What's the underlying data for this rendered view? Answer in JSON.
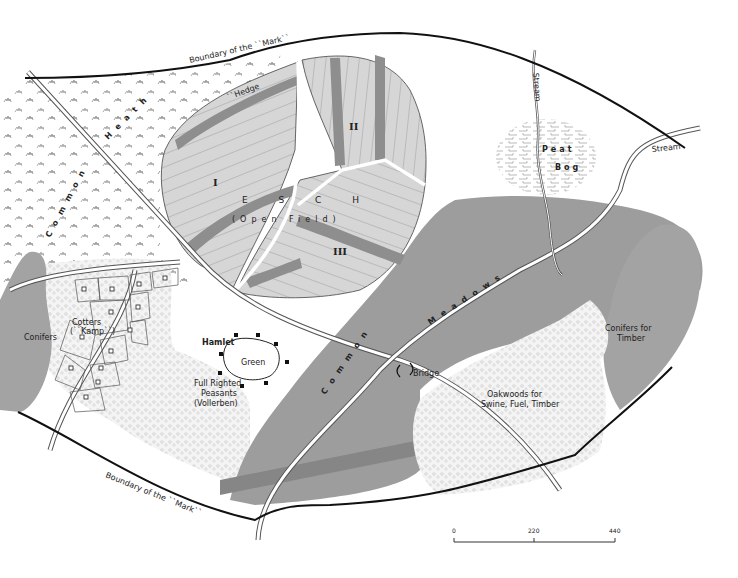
{
  "map": {
    "title": "Medieval Germanic village Mark (Esch and commons)",
    "colors": {
      "background": "#ffffff",
      "field_light": "#d4d4d4",
      "field_dark_strip": "#8e8e8e",
      "meadow_gray": "#9d9d9d",
      "conifer_gray": "#a3a3a3",
      "oakwood_stipple": "#f3f3f3",
      "boundary_line": "#111111",
      "road_edge": "#555555"
    },
    "labels": {
      "boundary_top": "Boundary of the ``Mark``",
      "boundary_bottom": "Boundary of the ``Mark``",
      "hedge": "``Hedge",
      "heath": "Heath",
      "common_heath": "Common",
      "stream_top": "Stream",
      "stream_right": "Stream",
      "peat_bog_line1": "Peat",
      "peat_bog_line2": "Bog",
      "esch": "E S C H",
      "open_field": "(Open Field)",
      "field_I": "I",
      "field_II": "II",
      "field_III": "III",
      "common_meadows_1": "Common",
      "common_meadows_2": "Meadows",
      "bridge": "Bridge",
      "conifers_left": "Conifers",
      "conifers_timber_1": "Conifers for",
      "conifers_timber_2": "Timber",
      "oakwoods_1": "Oakwoods for",
      "oakwoods_2": "Swine, Fuel, Timber",
      "cotters_1": "Cotters",
      "cotters_2": "(``Kamp``)",
      "hamlet": "Hamlet",
      "green": "Green",
      "peasants_1": "Full Righted",
      "peasants_2": "Peasants",
      "peasants_3": "(Vollerben)"
    },
    "scale_bar": {
      "ticks": [
        "0",
        "220",
        "440"
      ]
    }
  }
}
